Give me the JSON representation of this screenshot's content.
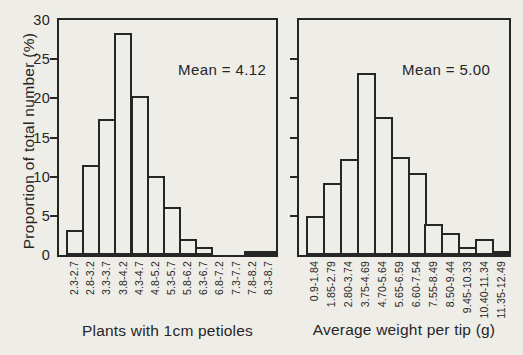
{
  "page": {
    "background": "#efede8",
    "ink": "#262626"
  },
  "y_axis": {
    "title": "Proportion of total number (%)",
    "tick_labels": [
      30,
      25,
      20,
      15,
      10,
      5,
      0
    ],
    "max": 30
  },
  "chart_data": [
    {
      "type": "bar",
      "panel": "left",
      "title": "",
      "annotation": "Mean = 4.12",
      "mean": 4.12,
      "xlabel": "Plants with 1cm petioles",
      "ylabel": "Proportion of total number (%)",
      "ylim": [
        0,
        30
      ],
      "yticks": [
        0,
        5,
        10,
        15,
        20,
        25,
        30
      ],
      "grid": false,
      "legend": "none",
      "categories": [
        "2.3-2.7",
        "2.8-3.2",
        "3.3-3.7",
        "3.8-4.2",
        "4.3-4.7",
        "4.8-5.2",
        "5.3-5.7",
        "5.8-6.2",
        "6.3-6.7",
        "6.8-7.2",
        "7.3-7.7",
        "7.8-8.2",
        "8.3-8.7"
      ],
      "values": [
        3.2,
        11.5,
        17.4,
        28.4,
        20.3,
        10.1,
        6.1,
        2.0,
        1.0,
        0,
        0,
        0.5,
        0.5
      ]
    },
    {
      "type": "bar",
      "panel": "right",
      "title": "",
      "annotation": "Mean = 5.00",
      "mean": 5.0,
      "xlabel": "Average weight per tip (g)",
      "ylabel": "Proportion of total number (%)",
      "ylim": [
        0,
        30
      ],
      "yticks": [
        0,
        5,
        10,
        15,
        20,
        25,
        30
      ],
      "grid": false,
      "legend": "none",
      "categories": [
        "0.9-1.84",
        "1.85-2.79",
        "2.80-3.74",
        "3.75-4.69",
        "4.70-5.64",
        "5.65-6.59",
        "6.60-7.54",
        "7.55-8.49",
        "8.50-9.44",
        "9.45-10.33",
        "10.40-11.34",
        "11.35-12.49"
      ],
      "values": [
        5.0,
        9.2,
        12.3,
        23.2,
        17.6,
        12.5,
        10.5,
        4.0,
        2.8,
        1.0,
        2.0,
        0.5
      ]
    }
  ]
}
